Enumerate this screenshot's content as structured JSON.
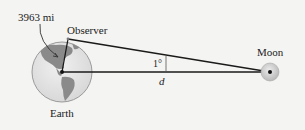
{
  "diagram": {
    "labels": {
      "radius": "3963 mi",
      "observer": "Observer",
      "earth": "Earth",
      "moon": "Moon",
      "angle": "1°",
      "distance": "d"
    },
    "colors": {
      "background": "#f4f4f2",
      "line": "#1a1a1a",
      "earth_ocean": "#e6e6e6",
      "earth_land": "#8a8a8a",
      "moon_fill": "#d0d0d0",
      "text": "#222222"
    }
  }
}
